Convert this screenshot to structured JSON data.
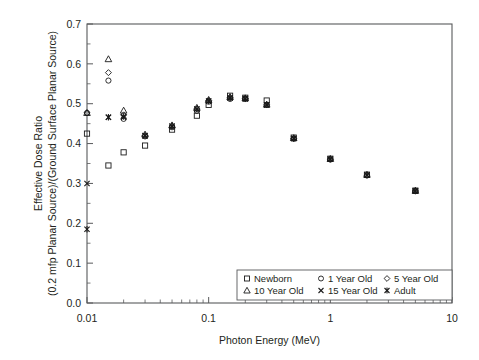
{
  "chart_data": {
    "type": "scatter",
    "title": "",
    "xlabel": "Photon Energy (MeV)",
    "ylabel_line1": "Effective Dose Ratio",
    "ylabel_line2": "(0.2 mfp Planar Source)/(Ground Surface Planar Source)",
    "xscale": "log",
    "yscale": "linear",
    "xlim": [
      0.01,
      10
    ],
    "ylim": [
      0.0,
      0.7
    ],
    "grid": false,
    "legend_position": "bottom-right",
    "x_tick_labels": [
      "0.01",
      "0.1",
      "1",
      "10"
    ],
    "x_tick_values": [
      0.01,
      0.1,
      1,
      10
    ],
    "y_tick_labels": [
      "0.0",
      "0.1",
      "0.2",
      "0.3",
      "0.4",
      "0.5",
      "0.6",
      "0.7"
    ],
    "y_tick_values": [
      0.0,
      0.1,
      0.2,
      0.3,
      0.4,
      0.5,
      0.6,
      0.7
    ],
    "y_minor_step": 0.05,
    "x": [
      0.01,
      0.015,
      0.02,
      0.03,
      0.05,
      0.08,
      0.1,
      0.15,
      0.2,
      0.3,
      0.5,
      1,
      2,
      5
    ],
    "series": [
      {
        "name": "Newborn",
        "marker": "square-open",
        "values": [
          0.425,
          0.345,
          0.378,
          0.395,
          0.435,
          0.47,
          0.497,
          0.52,
          0.515,
          0.508,
          0.415,
          0.362,
          0.322,
          0.282
        ]
      },
      {
        "name": "1 Year Old",
        "marker": "circle-open",
        "values": [
          0.477,
          0.558,
          0.462,
          0.418,
          0.441,
          0.482,
          0.505,
          0.512,
          0.512,
          0.497,
          0.412,
          0.36,
          0.32,
          0.281
        ]
      },
      {
        "name": "5 Year Old",
        "marker": "diamond-open",
        "values": [
          0.477,
          0.578,
          0.472,
          0.42,
          0.444,
          0.487,
          0.508,
          0.515,
          0.513,
          0.497,
          0.413,
          0.361,
          0.321,
          0.281
        ]
      },
      {
        "name": "10 Year Old",
        "marker": "triangle-open",
        "values": [
          0.477,
          0.612,
          0.483,
          0.423,
          0.446,
          0.49,
          0.51,
          0.517,
          0.514,
          0.498,
          0.414,
          0.362,
          0.322,
          0.282
        ]
      },
      {
        "name": "15 Year Old",
        "marker": "x-thin",
        "values": [
          0.3,
          0.466,
          0.466,
          0.419,
          0.443,
          0.486,
          0.506,
          0.514,
          0.512,
          0.497,
          0.413,
          0.361,
          0.321,
          0.281
        ]
      },
      {
        "name": "Adult",
        "marker": "asterisk",
        "values": [
          0.185,
          0.466,
          0.468,
          0.42,
          0.444,
          0.487,
          0.507,
          0.515,
          0.513,
          0.497,
          0.413,
          0.361,
          0.321,
          0.281
        ]
      }
    ]
  },
  "legend": {
    "entries": [
      {
        "label": "Newborn",
        "marker": "square-open"
      },
      {
        "label": "1 Year Old",
        "marker": "circle-open"
      },
      {
        "label": "5 Year Old",
        "marker": "diamond-open"
      },
      {
        "label": "10 Year Old",
        "marker": "triangle-open"
      },
      {
        "label": "15 Year Old",
        "marker": "x-thin"
      },
      {
        "label": "Adult",
        "marker": "asterisk"
      }
    ]
  },
  "colors": {
    "marker": "#1a1a1a",
    "axis": "#58595b",
    "text": "#231f20",
    "background": "#ffffff"
  }
}
